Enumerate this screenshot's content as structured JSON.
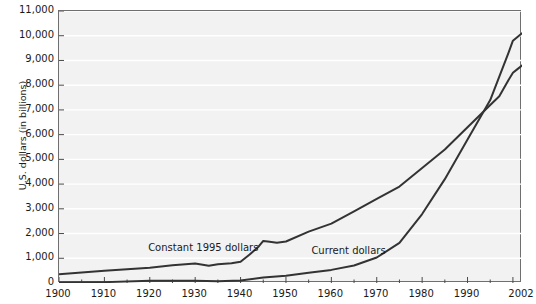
{
  "chart_data": {
    "type": "line",
    "title": "",
    "xlabel": "",
    "ylabel": "U.S. dollars (in billions)",
    "xlim": [
      1900,
      2002
    ],
    "ylim": [
      0,
      11000
    ],
    "grid": true,
    "legend_position": "inline-annotations",
    "ytick_labels": [
      "11,000",
      "10,000",
      "9,000",
      "8,000",
      "7,000",
      "6,000",
      "5,000",
      "4,000",
      "3,000",
      "2,000",
      "1,000",
      "0"
    ],
    "ytick_values": [
      11000,
      10000,
      9000,
      8000,
      7000,
      6000,
      5000,
      4000,
      3000,
      2000,
      1000,
      0
    ],
    "xtick_labels": [
      "1900",
      "1910",
      "1920",
      "1930",
      "1940",
      "1950",
      "1960",
      "1970",
      "1980",
      "1990",
      "2002"
    ],
    "xtick_values": [
      1900,
      1910,
      1920,
      1930,
      1940,
      1950,
      1960,
      1970,
      1980,
      1990,
      2002
    ],
    "minor_tick_interval": 5,
    "annotations": [
      {
        "text": "Constant 1995 dollars",
        "x": 1932,
        "y": 1420
      },
      {
        "text": "Current dollars",
        "x": 1964,
        "y": 1300
      }
    ],
    "series": [
      {
        "name": "Constant 1995 dollars",
        "color": "#333333",
        "x": [
          1900,
          1905,
          1910,
          1915,
          1920,
          1925,
          1930,
          1933,
          1935,
          1938,
          1940,
          1942,
          1944,
          1945,
          1946,
          1948,
          1950,
          1955,
          1960,
          1965,
          1970,
          1975,
          1980,
          1985,
          1990,
          1995,
          1997,
          1999,
          2000,
          2001,
          2002
        ],
        "values": [
          350,
          420,
          500,
          560,
          620,
          720,
          790,
          700,
          760,
          800,
          860,
          1150,
          1480,
          1700,
          1680,
          1630,
          1680,
          2080,
          2400,
          2900,
          3400,
          3900,
          4650,
          5400,
          6300,
          7200,
          7550,
          8200,
          8500,
          8650,
          8800
        ]
      },
      {
        "name": "Current dollars",
        "color": "#333333",
        "x": [
          1900,
          1910,
          1920,
          1930,
          1935,
          1940,
          1945,
          1950,
          1955,
          1960,
          1965,
          1970,
          1975,
          1980,
          1985,
          1990,
          1995,
          1997,
          1999,
          2000,
          2001,
          2002
        ],
        "values": [
          20,
          35,
          90,
          95,
          70,
          100,
          225,
          295,
          415,
          530,
          710,
          1030,
          1620,
          2790,
          4200,
          5800,
          7400,
          8350,
          9300,
          9800,
          9950,
          10100
        ]
      }
    ]
  }
}
